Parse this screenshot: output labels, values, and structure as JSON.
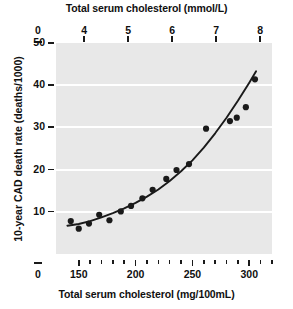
{
  "chart_data": {
    "type": "scatter",
    "title": "",
    "xlabel": "Total serum cholesterol (mg/100mL)",
    "xlabel_top": "Total serum cholesterol (mmol/L)",
    "ylabel": "10-year CAD death rate (deaths/1000)",
    "xlim": [
      130,
      320
    ],
    "ylim": [
      0,
      50
    ],
    "xlim_top": [
      3.36,
      8.27
    ],
    "grid": "horizontal-white",
    "legend": "none",
    "x_ticks_bottom": [
      {
        "value": 0,
        "label": "0",
        "type": "axis-break"
      },
      {
        "value": 150,
        "label": "150",
        "type": "major"
      },
      {
        "value": 160,
        "label": "",
        "type": "minor"
      },
      {
        "value": 170,
        "label": "",
        "type": "minor"
      },
      {
        "value": 180,
        "label": "",
        "type": "minor"
      },
      {
        "value": 190,
        "label": "",
        "type": "minor"
      },
      {
        "value": 200,
        "label": "200",
        "type": "major"
      },
      {
        "value": 210,
        "label": "",
        "type": "minor"
      },
      {
        "value": 220,
        "label": "",
        "type": "minor"
      },
      {
        "value": 230,
        "label": "",
        "type": "minor"
      },
      {
        "value": 240,
        "label": "",
        "type": "minor"
      },
      {
        "value": 250,
        "label": "250",
        "type": "major"
      },
      {
        "value": 260,
        "label": "",
        "type": "minor"
      },
      {
        "value": 270,
        "label": "",
        "type": "minor"
      },
      {
        "value": 280,
        "label": "",
        "type": "minor"
      },
      {
        "value": 290,
        "label": "",
        "type": "minor"
      },
      {
        "value": 300,
        "label": "300",
        "type": "major"
      },
      {
        "value": 310,
        "label": "",
        "type": "minor"
      },
      {
        "value": 320,
        "label": "",
        "type": "minor"
      }
    ],
    "x_ticks_top": [
      {
        "value": 0,
        "label": "0",
        "type": "axis-break"
      },
      {
        "value": 4,
        "label": "4",
        "type": "major"
      },
      {
        "value": 5,
        "label": "5",
        "type": "major"
      },
      {
        "value": 6,
        "label": "6",
        "type": "major"
      },
      {
        "value": 7,
        "label": "7",
        "type": "major"
      },
      {
        "value": 8,
        "label": "8",
        "type": "major"
      }
    ],
    "y_ticks": [
      {
        "value": 0,
        "label": "0"
      },
      {
        "value": 10,
        "label": "10"
      },
      {
        "value": 20,
        "label": "20"
      },
      {
        "value": 30,
        "label": "30"
      },
      {
        "value": 40,
        "label": "40"
      },
      {
        "value": 50,
        "label": "50"
      }
    ],
    "gridlines_y": [
      10,
      20,
      30,
      40
    ],
    "points": [
      {
        "x": 143,
        "y": 7.8
      },
      {
        "x": 150,
        "y": 6.0
      },
      {
        "x": 159,
        "y": 7.2
      },
      {
        "x": 168,
        "y": 9.3
      },
      {
        "x": 177,
        "y": 8.0
      },
      {
        "x": 187,
        "y": 10.1
      },
      {
        "x": 196,
        "y": 11.4
      },
      {
        "x": 206,
        "y": 13.2
      },
      {
        "x": 215,
        "y": 15.2
      },
      {
        "x": 227,
        "y": 17.8
      },
      {
        "x": 236,
        "y": 19.9
      },
      {
        "x": 247,
        "y": 21.3
      },
      {
        "x": 262,
        "y": 29.7
      },
      {
        "x": 283,
        "y": 31.5
      },
      {
        "x": 289,
        "y": 32.3
      },
      {
        "x": 297,
        "y": 34.8
      },
      {
        "x": 305,
        "y": 41.4
      }
    ],
    "fit_curve": [
      {
        "x": 140,
        "y": 6.7
      },
      {
        "x": 150,
        "y": 7.1
      },
      {
        "x": 160,
        "y": 7.8
      },
      {
        "x": 170,
        "y": 8.7
      },
      {
        "x": 180,
        "y": 9.7
      },
      {
        "x": 190,
        "y": 10.8
      },
      {
        "x": 200,
        "y": 12.1
      },
      {
        "x": 210,
        "y": 13.6
      },
      {
        "x": 220,
        "y": 15.3
      },
      {
        "x": 230,
        "y": 17.3
      },
      {
        "x": 240,
        "y": 19.6
      },
      {
        "x": 250,
        "y": 22.2
      },
      {
        "x": 260,
        "y": 25.2
      },
      {
        "x": 270,
        "y": 28.6
      },
      {
        "x": 280,
        "y": 32.3
      },
      {
        "x": 290,
        "y": 36.3
      },
      {
        "x": 300,
        "y": 40.6
      },
      {
        "x": 306,
        "y": 43.3
      }
    ],
    "marker_color": "#1a1a1a",
    "curve_color": "#1a1a1a",
    "plot_bg_color": "#e8e8e8",
    "grid_color": "#ffffff"
  }
}
